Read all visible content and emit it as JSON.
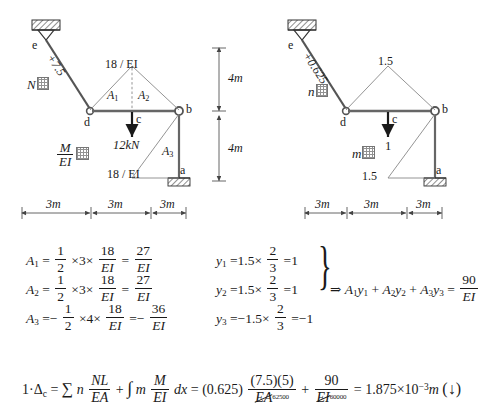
{
  "figure": {
    "left_diagram": {
      "name": "real-load-diagram",
      "n_diagram_label": "N",
      "n_diagram_suffix": "图",
      "m_ei_numerator": "M",
      "m_ei_denominator": "EI",
      "m_ei_suffix": "图",
      "member_force_label": "+7.5",
      "top_ordinate": "18 / EI",
      "bottom_ordinate": "18 / EI",
      "area_labels": [
        "A",
        "A",
        "A"
      ],
      "area_subs": [
        "1",
        "2",
        "3"
      ],
      "load_label": "12kN",
      "nodes": {
        "a": "a",
        "b": "b",
        "c": "c",
        "d": "d",
        "e": "e"
      }
    },
    "right_diagram": {
      "name": "virtual-unit-load-diagram",
      "n_diagram_label": "n",
      "n_diagram_suffix": "图",
      "m_diagram_label": "m",
      "m_diagram_suffix": "图",
      "member_force_label": "+0.625",
      "top_ordinate": "1.5",
      "bottom_ordinate": "1.5",
      "load_label": "1",
      "nodes": {
        "a": "a",
        "b": "b",
        "c": "c",
        "d": "d",
        "e": "e"
      }
    },
    "dimensions": {
      "horizontal": [
        "3m",
        "3m",
        "3m"
      ],
      "vertical": [
        "4m",
        "4m"
      ]
    }
  },
  "equations": {
    "area_rows": [
      {
        "name": "A",
        "sub": "1",
        "eq1": "=",
        "f1_nu": "1",
        "f1_de": "2",
        "t1": "×3×",
        "f2_nu": "18",
        "f2_de": "EI",
        "eq2": "=",
        "f3_nu": "27",
        "f3_de": "EI",
        "neg": false
      },
      {
        "name": "A",
        "sub": "2",
        "eq1": "=",
        "f1_nu": "1",
        "f1_de": "2",
        "t1": "×3×",
        "f2_nu": "18",
        "f2_de": "EI",
        "eq2": "=",
        "f3_nu": "27",
        "f3_de": "EI",
        "neg": false
      },
      {
        "name": "A",
        "sub": "3",
        "eq1": "=−",
        "f1_nu": "1",
        "f1_de": "2",
        "t1": "×4×",
        "f2_nu": "18",
        "f2_de": "EI",
        "eq2": "=−",
        "f3_nu": "36",
        "f3_de": "EI",
        "neg": true
      }
    ],
    "y_rows": [
      {
        "name": "y",
        "sub": "1",
        "lead": "=1.5×",
        "nu": "2",
        "de": "3",
        "tail": "=1"
      },
      {
        "name": "y",
        "sub": "2",
        "lead": "=1.5×",
        "nu": "2",
        "de": "3",
        "tail": "=1"
      },
      {
        "name": "y",
        "sub": "3",
        "lead": "=−1.5×",
        "nu": "2",
        "de": "3",
        "tail": "=−1"
      }
    ],
    "result": {
      "arrow": "⇒",
      "expr": "A₁y₁ + A₂y₂ + A₃y₃ =",
      "terms": [
        "A",
        "y",
        "+",
        "A",
        "y",
        "+",
        "A",
        "y",
        "="
      ],
      "value_nu": "90",
      "value_de": "EI"
    },
    "final": {
      "lhs": "1·Δ",
      "lhs_sub": "c",
      "eq1": "=",
      "sum": "∑",
      "n": "n",
      "NL_nu": "NL",
      "NL_de": "EA",
      "plus1": "+",
      "int": "∫",
      "m": "m",
      "M_nu": "M",
      "M_de": "EI",
      "dx": "dx",
      "eq2": "=",
      "coef": "(0.625)",
      "t1_nu": "(7.5)(5)",
      "t1_de": "EA",
      "t1_de_sup": "62500",
      "plus2": "+",
      "t2_nu": "90",
      "t2_de": "EI",
      "t2_de_sup": "60000",
      "eq3": "=",
      "answer": "1.875×10",
      "answer_exp": "−3",
      "answer_unit": "m",
      "direction": "(↓)"
    }
  }
}
